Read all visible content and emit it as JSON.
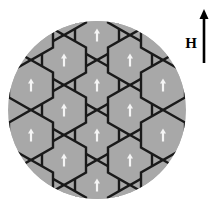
{
  "figure": {
    "background_color": "#ffffff"
  },
  "disc": {
    "name": "specimen-disc",
    "center_x": 97,
    "center_y": 110,
    "radius": 89,
    "fill_color": "#a8a8a8",
    "edge_color": "#a8a8a8"
  },
  "domain_grid": {
    "description": "pointy-top hexagonal domain cells clipped to the disc",
    "border_color": "#1a1a1a",
    "border_width": 2.4,
    "fill_color": "#a8a8a8",
    "hex_width": 44,
    "hex_height": 50,
    "column_spacing": 33,
    "row_spacing": 50,
    "column_offset": 25,
    "cell_count": 23,
    "cells": [
      {
        "cx": 97,
        "cy": 35
      },
      {
        "cx": 97,
        "cy": 85
      },
      {
        "cx": 97,
        "cy": 135
      },
      {
        "cx": 97,
        "cy": 185
      },
      {
        "cx": 64,
        "cy": 60
      },
      {
        "cx": 64,
        "cy": 110
      },
      {
        "cx": 64,
        "cy": 160
      },
      {
        "cx": 130,
        "cy": 60
      },
      {
        "cx": 130,
        "cy": 110
      },
      {
        "cx": 130,
        "cy": 160
      },
      {
        "cx": 31,
        "cy": 35
      },
      {
        "cx": 31,
        "cy": 85
      },
      {
        "cx": 31,
        "cy": 135
      },
      {
        "cx": 31,
        "cy": 185
      },
      {
        "cx": 163,
        "cy": 35
      },
      {
        "cx": 163,
        "cy": 85
      },
      {
        "cx": 163,
        "cy": 135
      },
      {
        "cx": 163,
        "cy": 185
      },
      {
        "cx": 64,
        "cy": 10
      },
      {
        "cx": 130,
        "cy": 10
      },
      {
        "cx": 64,
        "cy": 210
      },
      {
        "cx": 130,
        "cy": 210
      },
      {
        "cx": 97,
        "cy": 235
      }
    ]
  },
  "domain_arrow": {
    "name": "magnetization-arrow",
    "direction": "up",
    "color": "#f5f5f5",
    "stem_width": 2.2,
    "length": 13,
    "head_width": 6,
    "head_length": 5
  },
  "field_indicator": {
    "label": "H",
    "label_x": 191,
    "label_y": 48,
    "arrow_color": "#000000",
    "arrow_x": 204,
    "arrow_tail_y": 63,
    "arrow_tip_y": 9,
    "stem_width": 2.6,
    "head_width": 9,
    "head_length": 10
  },
  "chart_data": {
    "type": "diagram",
    "legend": [
      "H"
    ],
    "annotations": [
      "H"
    ],
    "series": [
      {
        "name": "domain-cells",
        "marker": "hexagon",
        "fill": "#a8a8a8",
        "count": 23
      },
      {
        "name": "magnetization-vectors",
        "marker": "up-arrow",
        "color": "#f5f5f5",
        "count": 23,
        "orientation_degrees": 90
      },
      {
        "name": "applied-field-vector",
        "marker": "up-arrow",
        "color": "#000000",
        "count": 1,
        "orientation_degrees": 90
      }
    ]
  }
}
